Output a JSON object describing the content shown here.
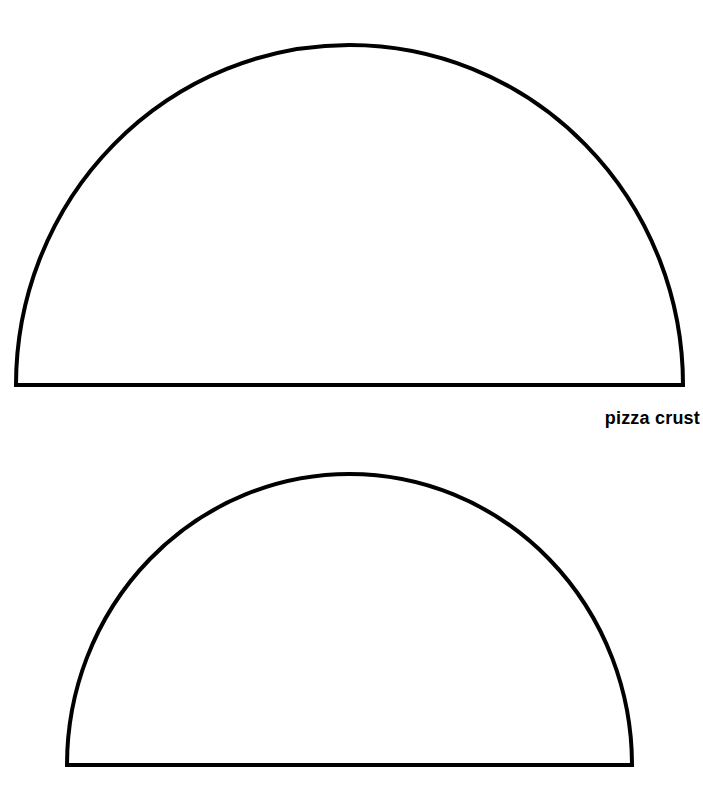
{
  "page": {
    "background_color": "#ffffff",
    "width": 703,
    "height": 790
  },
  "stroke": {
    "color": "#000000",
    "width": 4
  },
  "label": {
    "text": "pizza crust"
  },
  "shapes": [
    {
      "name": "large-pizza-crust-outline",
      "type": "half-ellipse",
      "left": 16,
      "right": 683,
      "baseline_y": 385,
      "apex_y": 45,
      "width": 667,
      "height": 340
    },
    {
      "name": "small-pizza-crust-outline",
      "type": "half-ellipse",
      "left": 67,
      "right": 632,
      "baseline_y": 765,
      "apex_y": 474,
      "width": 565,
      "height": 291
    }
  ]
}
